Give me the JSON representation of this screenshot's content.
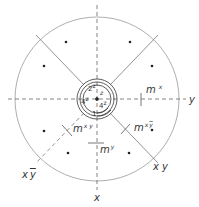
{
  "diagram": {
    "type": "stereographic-projection",
    "axes": {
      "x_label": "x",
      "y_label": "y",
      "diag_xy_label": "x y",
      "diag_xybar_label_x": "x",
      "diag_xybar_label_y": "y"
    },
    "mirrors": {
      "mx": {
        "base": "m",
        "sup": "x"
      },
      "my": {
        "base": "m",
        "sup": "y"
      },
      "mxy": {
        "base": "m",
        "sup": "x y"
      },
      "mxybar": {
        "base": "m",
        "sup_x": "x",
        "sup_y": "y"
      }
    },
    "center_labels": {
      "z_top": "z",
      "two_z": {
        "base": "2",
        "sup": "z"
      },
      "four_z_left": {
        "base": "4",
        "sup": "z"
      },
      "four_z_right": {
        "base": "4",
        "sup": "z"
      },
      "one": "1"
    },
    "points_count": 8,
    "colors": {
      "line": "#555555",
      "circle": "#999999",
      "text": "#333333"
    }
  }
}
